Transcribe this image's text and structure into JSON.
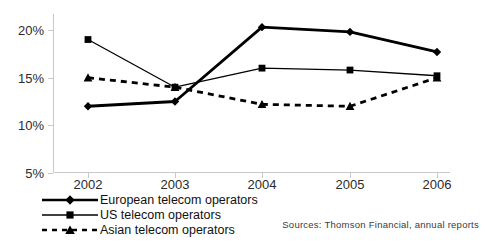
{
  "chart_data": {
    "type": "line",
    "title": "",
    "xlabel": "",
    "ylabel": "",
    "categories": [
      "2002",
      "2003",
      "2004",
      "2005",
      "2006"
    ],
    "series": [
      {
        "name": "European telecom operators",
        "marker": "diamond",
        "line_style": "solid",
        "line_width": "thick",
        "color": "#000000",
        "values": [
          12.0,
          12.5,
          20.3,
          19.8,
          17.7
        ]
      },
      {
        "name": "US telecom operators",
        "marker": "square",
        "line_style": "solid",
        "line_width": "thin",
        "color": "#000000",
        "values": [
          19.0,
          14.0,
          16.0,
          15.8,
          15.2
        ]
      },
      {
        "name": "Asian telecom operators",
        "marker": "triangle",
        "line_style": "dashed",
        "line_width": "thick",
        "color": "#000000",
        "values": [
          15.0,
          14.0,
          12.2,
          12.0,
          15.0
        ]
      }
    ],
    "ylim": [
      5,
      20
    ],
    "yticks": [
      5,
      10,
      15,
      20
    ],
    "ytick_labels": [
      "5%",
      "10%",
      "15%",
      "20%"
    ],
    "grid": false,
    "legend_position": "bottom-left"
  },
  "legend": {
    "items": [
      {
        "label": "European telecom operators"
      },
      {
        "label": "US telecom operators"
      },
      {
        "label": "Asian telecom operators"
      }
    ]
  },
  "footer": {
    "source": "Sources: Thomson Financial, annual reports"
  },
  "colors": {
    "ink": "#000000",
    "axis": "#c9c9c9",
    "tick_text": "#2b2b2b",
    "background": "#ffffff"
  }
}
